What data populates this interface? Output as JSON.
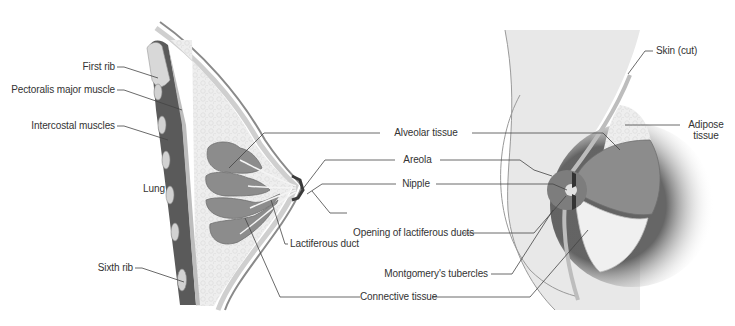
{
  "figure": {
    "colors": {
      "skin": "#e6e6e6",
      "skin_edge": "#8a8a8a",
      "adipose": "#efefef",
      "glandular": "#8c8c8c",
      "glandular_dark": "#6e6e6e",
      "muscle": "#5a5a5a",
      "rib": "#d8d8d8",
      "areola": "#7d7d7d",
      "leader_line": "#444444",
      "label_text": "#333333"
    }
  },
  "labels": {
    "left": {
      "first_rib": "First rib",
      "pectoralis_major": "Pectoralis major muscle",
      "intercostal": "Intercostal muscles",
      "lung": "Lung",
      "sixth_rib": "Sixth rib",
      "lactiferous_duct": "Lactiferous duct"
    },
    "center": {
      "alveolar_tissue": "Alveolar tissue",
      "areola": "Areola",
      "nipple": "Nipple",
      "opening_ducts": "Opening of lactiferous ducts",
      "montgomery": "Montgomery's tubercles",
      "connective_tissue": "Connective tissue"
    },
    "right": {
      "skin_cut": "Skin (cut)",
      "adipose_line1": "Adipose",
      "adipose_line2": "tissue"
    }
  }
}
